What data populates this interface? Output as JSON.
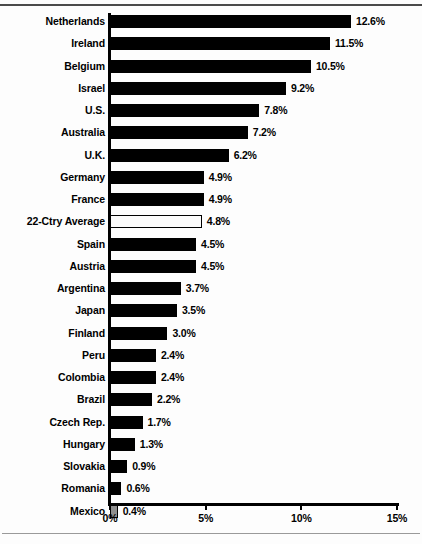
{
  "chart_data": {
    "type": "bar",
    "orientation": "horizontal",
    "title": "",
    "subtitle": "",
    "xlabel": "",
    "ylabel": "",
    "xlim": [
      0,
      15
    ],
    "xticks": [
      0,
      5,
      10,
      15
    ],
    "xtick_labels": [
      "0%",
      "5%",
      "10%",
      "15%"
    ],
    "grid": false,
    "legend": "none",
    "value_suffix": "%",
    "colors": {
      "bar_fill": "#000000",
      "highlight_fill": "#FFFFFF",
      "highlight_border": "#000000",
      "last_fill": "#8D8D8D",
      "axis": "#000000",
      "background": "#FFFFFF"
    },
    "categories": [
      "Netherlands",
      "Ireland",
      "Belgium",
      "Israel",
      "U.S.",
      "Australia",
      "U.K.",
      "Germany",
      "France",
      "22-Ctry Average",
      "Spain",
      "Austria",
      "Argentina",
      "Japan",
      "Finland",
      "Peru",
      "Colombia",
      "Brazil",
      "Czech Rep.",
      "Hungary",
      "Slovakia",
      "Romania",
      "Mexico"
    ],
    "values": [
      12.6,
      11.5,
      10.5,
      9.2,
      7.8,
      7.2,
      6.2,
      4.9,
      4.9,
      4.8,
      4.5,
      4.5,
      3.7,
      3.5,
      3.0,
      2.4,
      2.4,
      2.2,
      1.7,
      1.3,
      0.9,
      0.6,
      0.4
    ],
    "value_labels": [
      "12.6%",
      "11.5%",
      "10.5%",
      "9.2%",
      "7.8%",
      "7.2%",
      "6.2%",
      "4.9%",
      "4.9%",
      "4.8%",
      "4.5%",
      "4.5%",
      "3.7%",
      "3.5%",
      "3.0%",
      "2.4%",
      "2.4%",
      "2.2%",
      "1.7%",
      "1.3%",
      "0.9%",
      "0.6%",
      "0.4%"
    ],
    "bars": [
      {
        "category": "Netherlands",
        "value": 12.6,
        "label": "12.6%",
        "style": "solid"
      },
      {
        "category": "Ireland",
        "value": 11.5,
        "label": "11.5%",
        "style": "solid"
      },
      {
        "category": "Belgium",
        "value": 10.5,
        "label": "10.5%",
        "style": "solid"
      },
      {
        "category": "Israel",
        "value": 9.2,
        "label": "9.2%",
        "style": "solid"
      },
      {
        "category": "U.S.",
        "value": 7.8,
        "label": "7.8%",
        "style": "solid"
      },
      {
        "category": "Australia",
        "value": 7.2,
        "label": "7.2%",
        "style": "solid"
      },
      {
        "category": "U.K.",
        "value": 6.2,
        "label": "6.2%",
        "style": "solid"
      },
      {
        "category": "Germany",
        "value": 4.9,
        "label": "4.9%",
        "style": "solid"
      },
      {
        "category": "France",
        "value": 4.9,
        "label": "4.9%",
        "style": "solid"
      },
      {
        "category": "22-Ctry Average",
        "value": 4.8,
        "label": "4.8%",
        "style": "hollow"
      },
      {
        "category": "Spain",
        "value": 4.5,
        "label": "4.5%",
        "style": "solid"
      },
      {
        "category": "Austria",
        "value": 4.5,
        "label": "4.5%",
        "style": "solid"
      },
      {
        "category": "Argentina",
        "value": 3.7,
        "label": "3.7%",
        "style": "solid"
      },
      {
        "category": "Japan",
        "value": 3.5,
        "label": "3.5%",
        "style": "solid"
      },
      {
        "category": "Finland",
        "value": 3.0,
        "label": "3.0%",
        "style": "solid"
      },
      {
        "category": "Peru",
        "value": 2.4,
        "label": "2.4%",
        "style": "solid"
      },
      {
        "category": "Colombia",
        "value": 2.4,
        "label": "2.4%",
        "style": "solid"
      },
      {
        "category": "Brazil",
        "value": 2.2,
        "label": "2.2%",
        "style": "solid"
      },
      {
        "category": "Czech Rep.",
        "value": 1.7,
        "label": "1.7%",
        "style": "solid"
      },
      {
        "category": "Hungary",
        "value": 1.3,
        "label": "1.3%",
        "style": "solid"
      },
      {
        "category": "Slovakia",
        "value": 0.9,
        "label": "0.9%",
        "style": "solid"
      },
      {
        "category": "Romania",
        "value": 0.6,
        "label": "0.6%",
        "style": "solid"
      },
      {
        "category": "Mexico",
        "value": 0.4,
        "label": "0.4%",
        "style": "gray"
      }
    ]
  }
}
